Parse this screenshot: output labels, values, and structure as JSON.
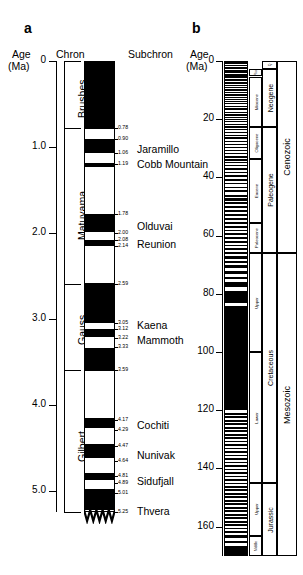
{
  "figure": {
    "panel_a_letter": "a",
    "panel_b_letter": "b"
  },
  "panel_a": {
    "axis": {
      "title_line1": "Age",
      "title_line2": "(Ma)",
      "ticks": [
        "0",
        "1.0",
        "2.0",
        "3.0",
        "4.0",
        "5.0"
      ],
      "range_ma": [
        0,
        5.25
      ]
    },
    "column_headers": {
      "chron": "Chron",
      "subchron": "Subchron"
    },
    "chrons": [
      {
        "name": "Brushes",
        "top_ma": 0.0,
        "base_ma": 0.78
      },
      {
        "name": "Matuyama",
        "top_ma": 0.78,
        "base_ma": 2.59
      },
      {
        "name": "Gauss",
        "top_ma": 2.59,
        "base_ma": 3.59
      },
      {
        "name": "Gilbert",
        "top_ma": 3.59,
        "base_ma": 5.25
      }
    ],
    "subchrons": [
      {
        "name": "Jaramillo",
        "top_ma": 0.99,
        "base_ma": 1.06
      },
      {
        "name": "Cobb Mountain",
        "top_ma": 1.19,
        "base_ma": 1.24
      },
      {
        "name": "Olduvai",
        "top_ma": 1.78,
        "base_ma": 2.0
      },
      {
        "name": "Reunion",
        "top_ma": 2.08,
        "base_ma": 2.14
      },
      {
        "name": "Kaena",
        "top_ma": 3.05,
        "base_ma": 3.12
      },
      {
        "name": "Mammoth",
        "top_ma": 3.22,
        "base_ma": 3.33
      },
      {
        "name": "Cochiti",
        "top_ma": 4.17,
        "base_ma": 4.29
      },
      {
        "name": "Nunivak",
        "top_ma": 4.47,
        "base_ma": 4.64
      },
      {
        "name": "Sidufjall",
        "top_ma": 4.81,
        "base_ma": 4.89
      },
      {
        "name": "Thvera",
        "top_ma": 5.01,
        "base_ma": 5.25
      }
    ],
    "boundary_ages": [
      "0.78",
      "0.90",
      "1.06",
      "1.19",
      "1.78",
      "2.00",
      "2.08",
      "2.14",
      "2.59",
      "3.05",
      "3.12",
      "3.22",
      "3.33",
      "3.59",
      "4.17",
      "4.29",
      "4.47",
      "4.64",
      "4.81",
      "4.89",
      "5.01",
      "5.25"
    ],
    "normal_polarity_intervals_ma": [
      [
        0.0,
        0.78
      ],
      [
        0.9,
        1.06
      ],
      [
        1.19,
        1.24
      ],
      [
        1.78,
        2.0
      ],
      [
        2.08,
        2.14
      ],
      [
        2.59,
        3.05
      ],
      [
        3.12,
        3.22
      ],
      [
        3.33,
        3.59
      ],
      [
        4.17,
        4.29
      ],
      [
        4.47,
        4.64
      ],
      [
        4.81,
        4.89
      ],
      [
        5.01,
        5.25
      ]
    ]
  },
  "panel_b": {
    "axis": {
      "title_line1": "Age",
      "title_line2": "(Ma)",
      "ticks": [
        "0",
        "20",
        "40",
        "60",
        "80",
        "100",
        "120",
        "140",
        "160"
      ],
      "range_ma": [
        0,
        170
      ]
    },
    "eras": [
      {
        "name": "Cenozoic",
        "top_ma": 0,
        "base_ma": 66
      },
      {
        "name": "Mesozoic",
        "top_ma": 66,
        "base_ma": 170
      }
    ],
    "systems": [
      {
        "name": "Q",
        "top_ma": 0,
        "base_ma": 2.6
      },
      {
        "name": "Neogene",
        "top_ma": 2.6,
        "base_ma": 23
      },
      {
        "name": "Paleogene",
        "top_ma": 23,
        "base_ma": 66
      },
      {
        "name": "Cretaceous",
        "top_ma": 66,
        "base_ma": 145
      },
      {
        "name": "Jurassic",
        "top_ma": 145,
        "base_ma": 170
      }
    ],
    "series": [
      {
        "name": "Plio",
        "top_ma": 2.6,
        "base_ma": 5.3
      },
      {
        "name": "Miocene",
        "top_ma": 5.3,
        "base_ma": 23
      },
      {
        "name": "Oligocene",
        "top_ma": 23,
        "base_ma": 34
      },
      {
        "name": "Eocene",
        "top_ma": 34,
        "base_ma": 56
      },
      {
        "name": "Paleocene",
        "top_ma": 56,
        "base_ma": 66
      },
      {
        "name": "Upper",
        "top_ma": 66,
        "base_ma": 100
      },
      {
        "name": "Lower",
        "top_ma": 100,
        "base_ma": 145
      },
      {
        "name": "Upper",
        "top_ma": 145,
        "base_ma": 163
      },
      {
        "name": "Middle",
        "top_ma": 163,
        "base_ma": 170
      }
    ],
    "normal_polarity_intervals_ma": [
      [
        0.0,
        0.8
      ],
      [
        0.9,
        1.1
      ],
      [
        1.2,
        1.25
      ],
      [
        1.8,
        2.0
      ],
      [
        2.1,
        2.15
      ],
      [
        2.6,
        3.05
      ],
      [
        3.15,
        3.2
      ],
      [
        3.35,
        3.6
      ],
      [
        4.2,
        4.3
      ],
      [
        4.5,
        4.65
      ],
      [
        4.8,
        4.9
      ],
      [
        5.0,
        5.25
      ],
      [
        5.9,
        6.1
      ],
      [
        6.3,
        6.6
      ],
      [
        6.9,
        7.1
      ],
      [
        7.4,
        7.6
      ],
      [
        8.0,
        8.3
      ],
      [
        8.7,
        9.0
      ],
      [
        9.3,
        9.5
      ],
      [
        9.8,
        10.0
      ],
      [
        10.3,
        10.6
      ],
      [
        11.0,
        11.2
      ],
      [
        11.5,
        11.8
      ],
      [
        12.1,
        12.4
      ],
      [
        12.8,
        13.0
      ],
      [
        13.4,
        13.7
      ],
      [
        14.2,
        14.6
      ],
      [
        15.0,
        15.2
      ],
      [
        15.8,
        16.0
      ],
      [
        16.3,
        16.6
      ],
      [
        17.2,
        17.5
      ],
      [
        18.0,
        18.5
      ],
      [
        19.0,
        19.3
      ],
      [
        19.8,
        20.1
      ],
      [
        20.5,
        20.8
      ],
      [
        21.3,
        21.8
      ],
      [
        22.2,
        22.6
      ],
      [
        23.0,
        23.4
      ],
      [
        24.0,
        24.4
      ],
      [
        25.0,
        25.4
      ],
      [
        26.0,
        26.5
      ],
      [
        27.2,
        27.6
      ],
      [
        28.2,
        28.6
      ],
      [
        29.2,
        29.6
      ],
      [
        30.2,
        30.8
      ],
      [
        31.4,
        31.8
      ],
      [
        32.4,
        33.0
      ],
      [
        33.5,
        34.0
      ],
      [
        34.6,
        35.0
      ],
      [
        35.5,
        36.0
      ],
      [
        36.6,
        37.2
      ],
      [
        37.8,
        38.4
      ],
      [
        39.0,
        39.5
      ],
      [
        40.2,
        41.0
      ],
      [
        41.6,
        42.2
      ],
      [
        43.0,
        43.6
      ],
      [
        44.2,
        45.0
      ],
      [
        45.8,
        46.4
      ],
      [
        47.0,
        47.8
      ],
      [
        48.4,
        49.0
      ],
      [
        49.6,
        50.4
      ],
      [
        51.0,
        51.8
      ],
      [
        52.4,
        53.2
      ],
      [
        53.8,
        54.4
      ],
      [
        55.0,
        55.8
      ],
      [
        56.4,
        57.2
      ],
      [
        57.8,
        58.4
      ],
      [
        59.0,
        59.8
      ],
      [
        60.4,
        61.0
      ],
      [
        61.8,
        62.4
      ],
      [
        63.0,
        63.6
      ],
      [
        64.2,
        65.0
      ],
      [
        65.6,
        66.2
      ],
      [
        67.0,
        67.8
      ],
      [
        68.5,
        69.2
      ],
      [
        70.0,
        71.0
      ],
      [
        72.0,
        73.0
      ],
      [
        74.0,
        75.0
      ],
      [
        76.0,
        77.5
      ],
      [
        79.0,
        83.0
      ],
      [
        84.0,
        120.0
      ],
      [
        121.0,
        121.6
      ],
      [
        122.2,
        122.8
      ],
      [
        123.4,
        124.0
      ],
      [
        124.6,
        125.2
      ],
      [
        125.8,
        126.4
      ],
      [
        127.0,
        127.6
      ],
      [
        128.2,
        128.8
      ],
      [
        129.4,
        130.0
      ],
      [
        130.6,
        131.2
      ],
      [
        131.8,
        132.4
      ],
      [
        133.0,
        133.6
      ],
      [
        134.2,
        134.8
      ],
      [
        135.4,
        136.0
      ],
      [
        136.6,
        137.2
      ],
      [
        137.8,
        138.4
      ],
      [
        139.0,
        139.6
      ],
      [
        140.2,
        140.8
      ],
      [
        141.4,
        142.0
      ],
      [
        142.6,
        143.2
      ],
      [
        143.8,
        144.4
      ],
      [
        145.0,
        145.6
      ],
      [
        146.2,
        146.8
      ],
      [
        147.4,
        148.0
      ],
      [
        148.6,
        149.2
      ],
      [
        149.8,
        150.4
      ],
      [
        151.0,
        151.6
      ],
      [
        152.2,
        152.8
      ],
      [
        153.4,
        154.0
      ],
      [
        154.6,
        155.2
      ],
      [
        155.8,
        156.4
      ],
      [
        157.0,
        157.6
      ],
      [
        158.2,
        158.8
      ],
      [
        159.4,
        160.0
      ],
      [
        160.6,
        161.2
      ],
      [
        161.8,
        162.4
      ],
      [
        163.0,
        164.0
      ],
      [
        165.0,
        166.0
      ],
      [
        167.0,
        170.0
      ]
    ]
  }
}
